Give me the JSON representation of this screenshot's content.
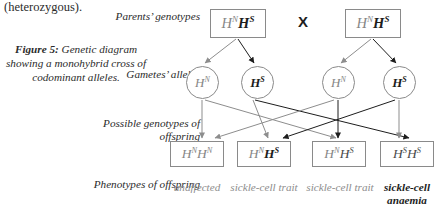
{
  "body_text": {
    "heterozygous_line": "(heterozygous)."
  },
  "caption": {
    "label": "Figure 5:",
    "text": " Genetic diagram showing a monohybrid cross of codominant alleles."
  },
  "row_labels": {
    "parents_genotypes": "Parents’ genotypes",
    "gametes_alleles": "Gametes’ alleles",
    "possible_genotypes": "Possible genotypes of offspring",
    "phenotypes": "Phenotypes of offspring"
  },
  "cross_symbol": "X",
  "parents": [
    {
      "name": "parent-1",
      "allele_1": "H",
      "sup_1": "N",
      "allele_2": "H",
      "sup_2": "S"
    },
    {
      "name": "parent-2",
      "allele_1": "H",
      "sup_1": "N",
      "allele_2": "H",
      "sup_2": "S"
    }
  ],
  "gametes": [
    {
      "name": "gamete-1",
      "allele": "H",
      "sup": "N"
    },
    {
      "name": "gamete-2",
      "allele": "H",
      "sup": "S"
    },
    {
      "name": "gamete-3",
      "allele": "H",
      "sup": "N"
    },
    {
      "name": "gamete-4",
      "allele": "H",
      "sup": "S"
    }
  ],
  "offspring": [
    {
      "name": "offspring-1",
      "allele_1": "H",
      "sup_1": "N",
      "allele_2": "H",
      "sup_2": "N"
    },
    {
      "name": "offspring-2",
      "allele_1": "H",
      "sup_1": "N",
      "allele_2": "H",
      "sup_2": "S"
    },
    {
      "name": "offspring-3",
      "allele_1": "H",
      "sup_1": "N",
      "allele_2": "H",
      "sup_2": "S"
    },
    {
      "name": "offspring-4",
      "allele_1": "H",
      "sup_1": "S",
      "allele_2": "H",
      "sup_2": "S"
    }
  ],
  "phenotypes": [
    "unaffected",
    "sickle-cell trait",
    "sickle-cell trait",
    "sickle-cell anaemia"
  ],
  "colors": {
    "page_background": "#ffffff",
    "stroke": "#8a8a8a",
    "text_dark": "#1d1d1d",
    "text_light": "#8d8d8d",
    "text_body": "#2b2b2b"
  }
}
